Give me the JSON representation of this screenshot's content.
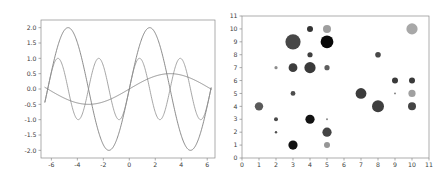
{
  "figure": {
    "background": "#ffffff",
    "panel_count": 2
  },
  "chart_data": [
    {
      "type": "line",
      "title": "",
      "xlabel": "",
      "ylabel": "",
      "xlim": [
        -6.8,
        6.6
      ],
      "ylim": [
        -2.25,
        2.25
      ],
      "xticks": [
        -6,
        -4,
        -2,
        0,
        2,
        4,
        6
      ],
      "xtick_labels": [
        "-6",
        "-4",
        "-2",
        "0",
        "2",
        "4",
        "6"
      ],
      "yticks": [
        -2.0,
        -1.5,
        -1.0,
        -0.5,
        0.0,
        0.5,
        1.0,
        1.5,
        2.0
      ],
      "ytick_labels": [
        "-2.0",
        "-1.5",
        "-1.0",
        "-0.5",
        "0.0",
        "0.5",
        "1.0",
        "1.5",
        "2.0"
      ],
      "grid": false,
      "legend": "none",
      "frame": true,
      "series": [
        {
          "name": "2*sin(x)",
          "color": "#6e6e6e",
          "amplitude": 2.0,
          "frequency": 1.0,
          "phase": 0.0,
          "linewidth": 0.8,
          "x_start": -6.5,
          "x_end": 6.3,
          "samples": 400
        },
        {
          "name": "sin(2x)",
          "color": "#8f8f8f",
          "amplitude": 1.0,
          "frequency": 2.0,
          "phase": 0.0,
          "linewidth": 0.8,
          "x_start": -6.5,
          "x_end": 6.3,
          "samples": 400
        },
        {
          "name": "0.5*sin(0.5x)",
          "color": "#767676",
          "amplitude": 0.5,
          "frequency": 0.5,
          "phase": 0.0,
          "linewidth": 0.8,
          "x_start": -6.5,
          "x_end": 6.3,
          "samples": 400
        }
      ]
    },
    {
      "type": "scatter",
      "title": "",
      "xlabel": "",
      "ylabel": "",
      "xlim": [
        0,
        11
      ],
      "ylim": [
        0,
        11
      ],
      "xticks": [
        0,
        1,
        2,
        3,
        4,
        5,
        6,
        7,
        8,
        9,
        10,
        11
      ],
      "xtick_labels": [
        "0",
        "1",
        "2",
        "3",
        "4",
        "5",
        "6",
        "7",
        "8",
        "9",
        "10",
        "11"
      ],
      "yticks": [
        0,
        1,
        2,
        3,
        4,
        5,
        6,
        7,
        8,
        9,
        10,
        11
      ],
      "ytick_labels": [
        "0",
        "1",
        "2",
        "3",
        "4",
        "5",
        "6",
        "7",
        "8",
        "9",
        "10",
        "11"
      ],
      "grid": false,
      "legend": "none",
      "frame": true,
      "colormap": "gray",
      "points": [
        {
          "x": 1,
          "y": 4,
          "size": 4.2,
          "color": "#5a5a5a"
        },
        {
          "x": 2,
          "y": 2,
          "size": 1.2,
          "color": "#4f4f4f"
        },
        {
          "x": 2,
          "y": 3,
          "size": 2.0,
          "color": "#4a4a4a"
        },
        {
          "x": 2,
          "y": 7,
          "size": 1.6,
          "color": "#8c8c8c"
        },
        {
          "x": 3,
          "y": 1,
          "size": 4.6,
          "color": "#121212"
        },
        {
          "x": 3,
          "y": 5,
          "size": 2.4,
          "color": "#4d4d4d"
        },
        {
          "x": 3,
          "y": 7,
          "size": 4.4,
          "color": "#3d3d3d"
        },
        {
          "x": 3,
          "y": 9,
          "size": 7.6,
          "color": "#474747"
        },
        {
          "x": 4,
          "y": 3,
          "size": 4.6,
          "color": "#121212"
        },
        {
          "x": 4,
          "y": 7,
          "size": 5.6,
          "color": "#3a3a3a"
        },
        {
          "x": 4,
          "y": 8,
          "size": 2.6,
          "color": "#3f3f3f"
        },
        {
          "x": 4,
          "y": 10,
          "size": 3.0,
          "color": "#343434"
        },
        {
          "x": 5,
          "y": 1,
          "size": 3.0,
          "color": "#969696"
        },
        {
          "x": 5,
          "y": 2,
          "size": 4.6,
          "color": "#444444"
        },
        {
          "x": 5,
          "y": 3,
          "size": 1.0,
          "color": "#8a8a8a"
        },
        {
          "x": 5,
          "y": 7,
          "size": 2.6,
          "color": "#5e5e5e"
        },
        {
          "x": 5,
          "y": 9,
          "size": 6.4,
          "color": "#080808"
        },
        {
          "x": 5,
          "y": 10,
          "size": 4.0,
          "color": "#9e9e9e"
        },
        {
          "x": 7,
          "y": 5,
          "size": 5.4,
          "color": "#3c3c3c"
        },
        {
          "x": 8,
          "y": 4,
          "size": 6.0,
          "color": "#3f3f3f"
        },
        {
          "x": 8,
          "y": 8,
          "size": 2.8,
          "color": "#484848"
        },
        {
          "x": 9,
          "y": 5,
          "size": 0.9,
          "color": "#777777"
        },
        {
          "x": 9,
          "y": 6,
          "size": 3.0,
          "color": "#3a3a3a"
        },
        {
          "x": 10,
          "y": 4,
          "size": 4.0,
          "color": "#444444"
        },
        {
          "x": 10,
          "y": 5,
          "size": 3.6,
          "color": "#a0a0a0"
        },
        {
          "x": 10,
          "y": 6,
          "size": 3.0,
          "color": "#3a3a3a"
        },
        {
          "x": 10,
          "y": 10,
          "size": 5.6,
          "color": "#a8a8a8"
        }
      ]
    }
  ]
}
